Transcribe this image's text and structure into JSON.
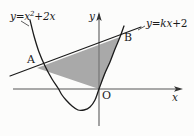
{
  "figure": {
    "width": 194,
    "height": 136,
    "background_color": "#fcfcfb",
    "stroke_color": "#1b1b1b",
    "shade_color": "#a9a9a9"
  },
  "labels": {
    "curve_equation_lhs": "y",
    "curve_equation_eq": "=",
    "curve_equation_var": "x",
    "curve_equation_exp": "2",
    "curve_equation_plus": "+",
    "curve_equation_term": "2x",
    "line_equation_lhs": "y",
    "line_equation_eq": "=",
    "line_equation_slope": "kx",
    "line_equation_plus": "+",
    "line_equation_const": "2",
    "y_axis": "y",
    "x_axis": "x",
    "point_a": "A",
    "point_b": "B",
    "origin": "O"
  },
  "chart_data": {
    "type": "line",
    "xlabel": "x",
    "ylabel": "y",
    "grid": false,
    "legend": "none",
    "annotations": [
      "A",
      "B",
      "O"
    ],
    "series": [
      {
        "name": "y=x^2+2x",
        "type": "parabola",
        "equation": "y = x^2 + 2x",
        "opens": "up",
        "vertex_screen": [
          62,
          120
        ],
        "roots_screen": [
          [
            25,
            89
          ],
          [
            99,
            89
          ]
        ],
        "path_points_screen": [
          [
            30,
            20
          ],
          [
            34,
            36
          ],
          [
            39,
            52
          ],
          [
            45,
            66
          ],
          [
            52,
            79
          ],
          [
            58,
            88
          ],
          [
            62,
            95
          ],
          [
            66,
            100
          ],
          [
            72,
            106
          ],
          [
            78,
            110
          ],
          [
            84,
            110
          ],
          [
            90,
            107
          ],
          [
            95,
            100
          ],
          [
            99,
            89
          ],
          [
            105,
            73
          ],
          [
            110,
            62
          ],
          [
            115,
            49
          ],
          [
            120,
            37
          ],
          [
            124,
            26
          ]
        ]
      },
      {
        "name": "y=kx+2",
        "type": "line",
        "equation": "y = kx + 2",
        "endpoints_screen": [
          [
            10,
            76
          ],
          [
            140,
            27
          ]
        ]
      }
    ],
    "points": [
      {
        "label": "A",
        "screen": [
          37,
          68
        ],
        "role": "left intersection of line and parabola"
      },
      {
        "label": "B",
        "screen": [
          120,
          37
        ],
        "role": "right intersection of line and parabola"
      },
      {
        "label": "O",
        "screen": [
          99,
          89
        ],
        "role": "origin"
      }
    ],
    "shaded_region": {
      "name": "triangle AOB",
      "vertices_screen": [
        [
          37,
          68
        ],
        [
          120,
          37
        ],
        [
          99,
          89
        ]
      ],
      "fill": "#a9a9a9"
    },
    "axes": {
      "x_axis_screen": {
        "y": 89,
        "x_start": 13,
        "x_end": 182,
        "arrow": "right"
      },
      "y_axis_screen": {
        "x": 99,
        "y_start": 125,
        "y_end": 12,
        "arrow": "up"
      }
    }
  }
}
